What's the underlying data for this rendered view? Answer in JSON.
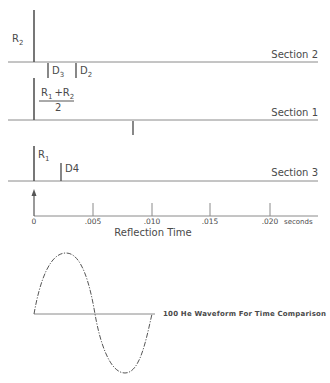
{
  "sections": [
    {
      "name": "Section 2",
      "peak_label": {
        "main": "R",
        "sub": "2"
      },
      "defects": [
        {
          "main": "D",
          "sub": "3"
        },
        {
          "main": "D",
          "sub": "2"
        }
      ]
    },
    {
      "name": "Section 1",
      "peak_label": {
        "num_a": "R",
        "num_a_sub": "1",
        "plus": "+R",
        "num_b_sub": "2",
        "den": "2"
      }
    },
    {
      "name": "Section 3",
      "peak_label": {
        "main": "R",
        "sub": "1"
      },
      "defects": [
        {
          "main": "D4"
        }
      ]
    }
  ],
  "axis": {
    "ticks": [
      "0",
      ".005",
      ".010",
      ".015",
      ".020"
    ],
    "unit": "seconds",
    "title": "Reflection Time"
  },
  "waveform": {
    "label": "100 He Waveform For Time Comparison"
  },
  "colors": {
    "line": "#555555",
    "text": "#4a4a4a",
    "background": "#ffffff"
  }
}
